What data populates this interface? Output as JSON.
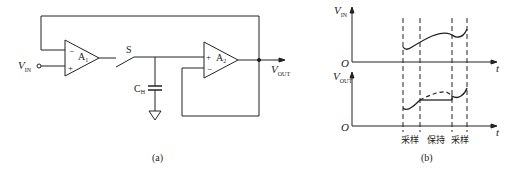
{
  "panel_a": {
    "caption": "(a)",
    "vin_label_main": "V",
    "vin_label_sub": "IN",
    "amp1_label_main": "A",
    "amp1_label_sub": "1",
    "amp1_minus": "−",
    "amp1_plus": "+",
    "switch_label": "S",
    "cap_label_main": "C",
    "cap_label_sub": "H",
    "amp2_label_main": "A",
    "amp2_label_sub": "2",
    "amp2_plus": "+",
    "amp2_minus": "−",
    "vout_label_main": "V",
    "vout_label_sub": "OUT"
  },
  "panel_b": {
    "caption": "(b)",
    "top_axis_y_main": "V",
    "top_axis_y_sub": "IN",
    "top_origin": "O",
    "top_axis_x": "t",
    "bottom_axis_y_main": "V",
    "bottom_axis_y_sub": "OUT",
    "bottom_origin": "O",
    "bottom_axis_x": "t",
    "phase_labels": [
      "采样",
      "保持",
      "采样"
    ]
  },
  "colors": {
    "line": "#222222",
    "background": "#ffffff"
  }
}
